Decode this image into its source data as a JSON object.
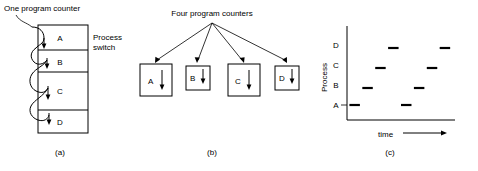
{
  "figure": {
    "panel_a": {
      "caption": "(a)",
      "title": "One program counter",
      "annotation": "Process\nswitch",
      "annotation_line1": "Process",
      "annotation_line2": "switch",
      "processes": [
        {
          "label": "A",
          "height_units": 2
        },
        {
          "label": "B",
          "height_units": 2
        },
        {
          "label": "C",
          "height_units": 3
        },
        {
          "label": "D",
          "height_units": 2
        }
      ]
    },
    "panel_b": {
      "caption": "(b)",
      "title": "Four program counters",
      "processes": [
        {
          "label": "A",
          "size": "large"
        },
        {
          "label": "B",
          "size": "small"
        },
        {
          "label": "C",
          "size": "large"
        },
        {
          "label": "D",
          "size": "small"
        }
      ]
    },
    "panel_c": {
      "caption": "(c)",
      "ylabel": "Process",
      "xlabel": "time",
      "ytick_labels": [
        "D",
        "C",
        "B",
        "A"
      ]
    }
  },
  "chart_data": {
    "type": "scatter",
    "title": "",
    "xlabel": "time",
    "ylabel": "Process",
    "categories": [
      "A",
      "B",
      "C",
      "D"
    ],
    "ytick_labels": [
      "A",
      "B",
      "C",
      "D"
    ],
    "xlim": [
      0,
      10
    ],
    "ylim": [
      0,
      5
    ],
    "grid": false,
    "legend": false,
    "axis_arrow_x": true,
    "series": [
      {
        "name": "running process over time",
        "points": [
          {
            "process": "A",
            "t_start": 0.3,
            "t_end": 1.6
          },
          {
            "process": "B",
            "t_start": 1.9,
            "t_end": 3.2
          },
          {
            "process": "C",
            "t_start": 3.5,
            "t_end": 4.8
          },
          {
            "process": "D",
            "t_start": 5.1,
            "t_end": 6.4
          },
          {
            "process": "A",
            "t_start": 6.7,
            "t_end": 8.0
          },
          {
            "process": "B",
            "t_start": 8.3,
            "t_end": 9.6
          },
          {
            "process": "C",
            "t_start": 9.9,
            "t_end": 11.2
          },
          {
            "process": "D",
            "t_start": 11.5,
            "t_end": 12.8
          }
        ]
      }
    ],
    "annotations": []
  }
}
